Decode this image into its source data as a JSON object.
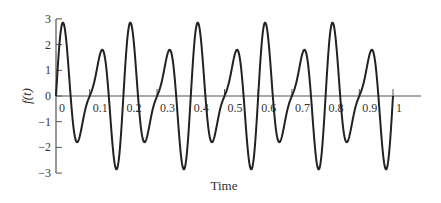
{
  "chart_data": {
    "type": "line",
    "title": "",
    "xlabel": "Time",
    "ylabel": "f(t)",
    "xlim": [
      0,
      1
    ],
    "ylim": [
      -3,
      3
    ],
    "grid": false,
    "legend": null,
    "x_ticks": [
      "0",
      "0.1",
      "0.2",
      "0.3",
      "0.4",
      "0.5",
      "0.6",
      "0.7",
      "0.8",
      "0.9",
      "1"
    ],
    "y_ticks": [
      "3",
      "2",
      "1",
      "0",
      "-1",
      "-2",
      "-3"
    ],
    "function": "f(t) = 2 sin(20πt) + sin(30πt)",
    "series": [
      {
        "name": "f(t)",
        "color": "#222222",
        "x": [
          0,
          0.02,
          0.04,
          0.061,
          0.08,
          0.1,
          0.12,
          0.136,
          0.16,
          0.178,
          0.2,
          0.22,
          0.261,
          0.336,
          0.378,
          0.42,
          0.461,
          0.536,
          0.578,
          0.62,
          0.661,
          0.736,
          0.778,
          0.82,
          0.861,
          0.936,
          0.978,
          1.0
        ],
        "values": [
          0,
          2.85,
          0.0,
          -1.78,
          -0.18,
          0,
          0.18,
          1.79,
          0.0,
          -2.84,
          0,
          2.85,
          -1.78,
          1.79,
          -2.84,
          2.85,
          -1.78,
          1.79,
          -2.84,
          2.85,
          -1.78,
          1.79,
          -2.84,
          2.85,
          -1.78,
          1.79,
          -2.84,
          0
        ]
      }
    ],
    "coeffs": {
      "a": 2,
      "fa": 10,
      "b": 1,
      "fb": 15
    }
  },
  "labels": {
    "x_title": "Time",
    "y_title": "f(t)"
  }
}
